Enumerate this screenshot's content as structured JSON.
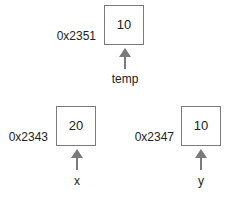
{
  "variables": [
    {
      "name": "temp",
      "address": "0x2351",
      "value": "10"
    },
    {
      "name": "x",
      "address": "0x2343",
      "value": "20"
    },
    {
      "name": "y",
      "address": "0x2347",
      "value": "10"
    }
  ],
  "colors": {
    "box_border": "#7a7a7a",
    "arrow": "#7a7a7a"
  }
}
